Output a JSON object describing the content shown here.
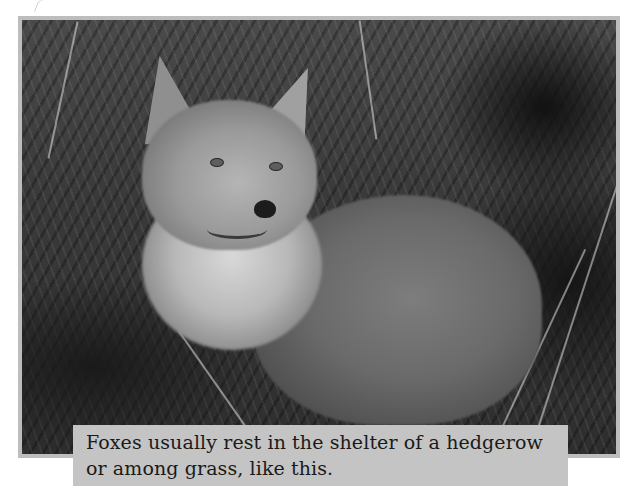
{
  "figure": {
    "image": {
      "subject": "fox resting in grass",
      "tone": "grayscale",
      "frame_color": "#bdbdbd"
    },
    "caption": {
      "text": "Foxes usually rest in the shelter of a hedgerow or among grass, like this.",
      "background": "#c4c4c4",
      "color": "#1a1a1a"
    }
  }
}
